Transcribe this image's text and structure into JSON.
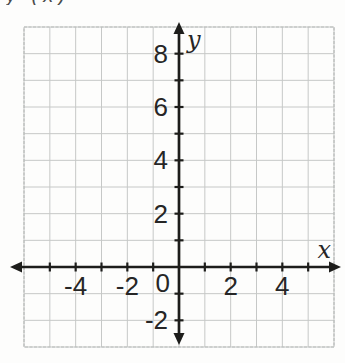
{
  "figure": {
    "cropped_text_fragment": "y (x)"
  },
  "chart_data": {
    "type": "scatter",
    "series": [],
    "title": "",
    "xlabel": "x",
    "ylabel": "y",
    "origin_label": "0",
    "xlim": [
      -6,
      6
    ],
    "ylim": [
      -3,
      9
    ],
    "grid": true,
    "grid_step": 1,
    "x_ticks": [
      -5,
      -4,
      -3,
      -2,
      -1,
      1,
      2,
      3,
      4,
      5
    ],
    "y_ticks": [
      -2,
      -1,
      1,
      2,
      3,
      4,
      5,
      6,
      7,
      8
    ],
    "x_tick_labels": [
      {
        "value": -4,
        "label": "-4"
      },
      {
        "value": -2,
        "label": "-2"
      },
      {
        "value": 2,
        "label": "2"
      },
      {
        "value": 4,
        "label": "4"
      }
    ],
    "y_tick_labels": [
      {
        "value": 8,
        "label": "8"
      },
      {
        "value": 6,
        "label": "6"
      },
      {
        "value": 4,
        "label": "4"
      },
      {
        "value": 2,
        "label": "2"
      },
      {
        "value": -2,
        "label": "-2"
      }
    ],
    "legend": null,
    "colors": {
      "axis": "#1d1d1b",
      "grid": "#c6c8c7",
      "grid_border": "#b8bbba",
      "labels": "#262626",
      "background": "#fdfdfc"
    }
  }
}
